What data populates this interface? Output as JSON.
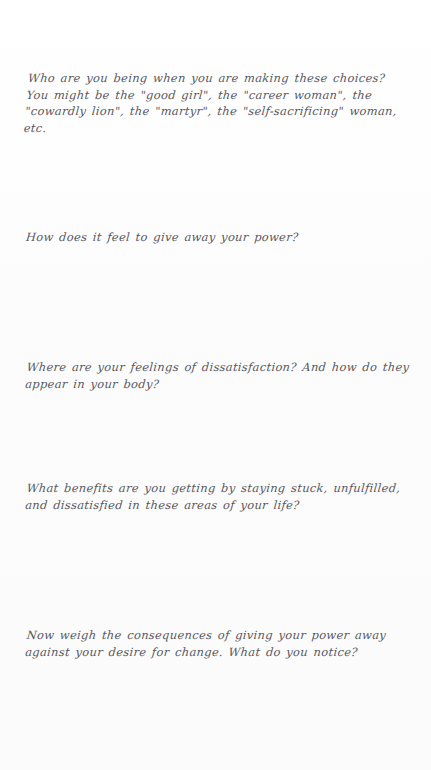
{
  "document": {
    "type": "handwritten-workbook-page",
    "background_color": "#fdfdfd",
    "ink_color": "#4a4a52",
    "prompts": [
      {
        "id": "prompt-identity",
        "text": "Who are you being when you are making these choices? You might be the \"good girl\", the \"career woman\", the \"cowardly lion\", the \"martyr\", the \"self-sacrificing\" woman, etc."
      },
      {
        "id": "prompt-feeling-power",
        "text": "How does it feel to give away your power?"
      },
      {
        "id": "prompt-dissatisfaction",
        "text": "Where are your feelings of dissatisfaction? And how do they appear in your body?"
      },
      {
        "id": "prompt-benefits",
        "text": "What benefits are you getting by staying stuck, unfulfilled, and dissatisfied in these areas of your life?"
      },
      {
        "id": "prompt-weigh-consequences",
        "text": "Now weigh the consequences of giving your power away against your desire for change. What do you notice?"
      }
    ],
    "answer_spaces": [
      {
        "id": "answer-space-1",
        "label": "blank writing space"
      },
      {
        "id": "answer-space-2",
        "label": "blank writing space"
      },
      {
        "id": "answer-space-3",
        "label": "blank writing space"
      },
      {
        "id": "answer-space-4",
        "label": "blank writing space"
      },
      {
        "id": "answer-space-5",
        "label": "blank writing space"
      }
    ]
  }
}
